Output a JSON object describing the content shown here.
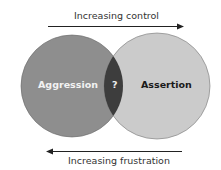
{
  "top_arrow": {
    "label": "Increasing control",
    "direction": "right"
  },
  "bottom_arrow": {
    "label": "Increasing frustration",
    "direction": "left"
  },
  "circles": {
    "left": {
      "label": "Aggression",
      "color": "#8e8e8e"
    },
    "right": {
      "label": "Assertion",
      "color": "#cbcbcb"
    },
    "overlap": {
      "label": "?",
      "color": "#3d3d3d"
    }
  }
}
